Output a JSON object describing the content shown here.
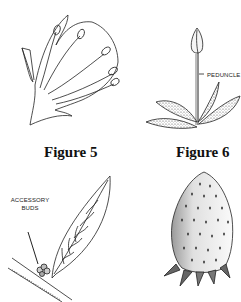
{
  "figures": [
    {
      "id": "figure-5",
      "caption": "Figure 5",
      "subject": "flower petals with stamens"
    },
    {
      "id": "figure-6",
      "caption": "Figure 6",
      "subject": "strawberry flower bud on peduncle with leaves",
      "labels": [
        "PEDUNCLE"
      ]
    },
    {
      "id": "figure-7",
      "subject": "leaf on stem with accessory buds",
      "labels": [
        "ACCESSORY",
        "BUDS"
      ]
    },
    {
      "id": "figure-8",
      "subject": "strawberry fruit with seeds and calyx"
    }
  ]
}
